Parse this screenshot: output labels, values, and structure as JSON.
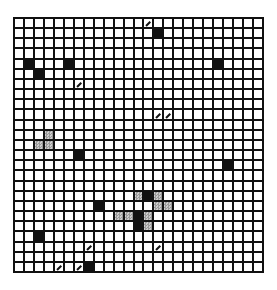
{
  "board": {
    "rows": 25,
    "cols": 25,
    "colors": {
      "line": "#111111",
      "empty": "#ffffff",
      "filled": "#111111",
      "shaded": "#aaaaaa"
    },
    "cells": [
      {
        "r": 1,
        "c": 14,
        "type": "black"
      },
      {
        "r": 4,
        "c": 1,
        "type": "black"
      },
      {
        "r": 5,
        "c": 2,
        "type": "black"
      },
      {
        "r": 4,
        "c": 5,
        "type": "black"
      },
      {
        "r": 4,
        "c": 20,
        "type": "black"
      },
      {
        "r": 13,
        "c": 6,
        "type": "black"
      },
      {
        "r": 14,
        "c": 21,
        "type": "black"
      },
      {
        "r": 18,
        "c": 8,
        "type": "black"
      },
      {
        "r": 17,
        "c": 13,
        "type": "black"
      },
      {
        "r": 19,
        "c": 12,
        "type": "black"
      },
      {
        "r": 20,
        "c": 12,
        "type": "black"
      },
      {
        "r": 21,
        "c": 2,
        "type": "black"
      },
      {
        "r": 24,
        "c": 7,
        "type": "black"
      },
      {
        "r": 11,
        "c": 3,
        "type": "gray"
      },
      {
        "r": 12,
        "c": 2,
        "type": "gray"
      },
      {
        "r": 12,
        "c": 3,
        "type": "gray"
      },
      {
        "r": 17,
        "c": 12,
        "type": "gray"
      },
      {
        "r": 17,
        "c": 14,
        "type": "gray"
      },
      {
        "r": 18,
        "c": 14,
        "type": "gray"
      },
      {
        "r": 18,
        "c": 15,
        "type": "gray"
      },
      {
        "r": 19,
        "c": 10,
        "type": "gray"
      },
      {
        "r": 19,
        "c": 11,
        "type": "gray"
      },
      {
        "r": 19,
        "c": 13,
        "type": "gray"
      },
      {
        "r": 20,
        "c": 13,
        "type": "gray"
      },
      {
        "r": 0,
        "c": 13,
        "type": "slash"
      },
      {
        "r": 6,
        "c": 6,
        "type": "slash"
      },
      {
        "r": 9,
        "c": 14,
        "type": "slash"
      },
      {
        "r": 9,
        "c": 15,
        "type": "slash"
      },
      {
        "r": 22,
        "c": 7,
        "type": "slash"
      },
      {
        "r": 22,
        "c": 14,
        "type": "slash"
      },
      {
        "r": 24,
        "c": 4,
        "type": "slash"
      },
      {
        "r": 24,
        "c": 6,
        "type": "slash"
      }
    ]
  }
}
